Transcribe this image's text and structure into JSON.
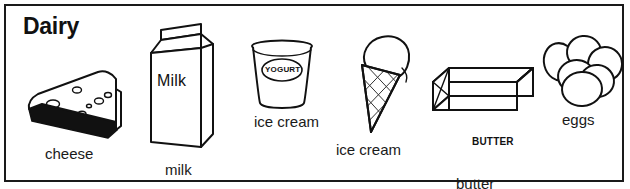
{
  "poster": {
    "title": "Dairy",
    "border_color": "#1a1a1a",
    "background_color": "#ffffff",
    "ink_color": "#111111"
  },
  "items": [
    {
      "id": "cheese",
      "icon": "cheese-wedge-icon",
      "caption": "cheese",
      "inline_label": ""
    },
    {
      "id": "milk",
      "icon": "milk-carton-icon",
      "caption": "milk",
      "inline_label": "Milk"
    },
    {
      "id": "yogurt",
      "icon": "yogurt-cup-icon",
      "caption": "yogurt",
      "inline_label": "YOGURT"
    },
    {
      "id": "ice-cream",
      "icon": "ice-cream-cone-icon",
      "caption": "ice cream",
      "inline_label": ""
    },
    {
      "id": "butter",
      "icon": "butter-stick-icon",
      "caption": "butter",
      "inline_label": "BUTTER"
    },
    {
      "id": "eggs",
      "icon": "eggs-cluster-icon",
      "caption": "eggs",
      "inline_label": ""
    }
  ]
}
